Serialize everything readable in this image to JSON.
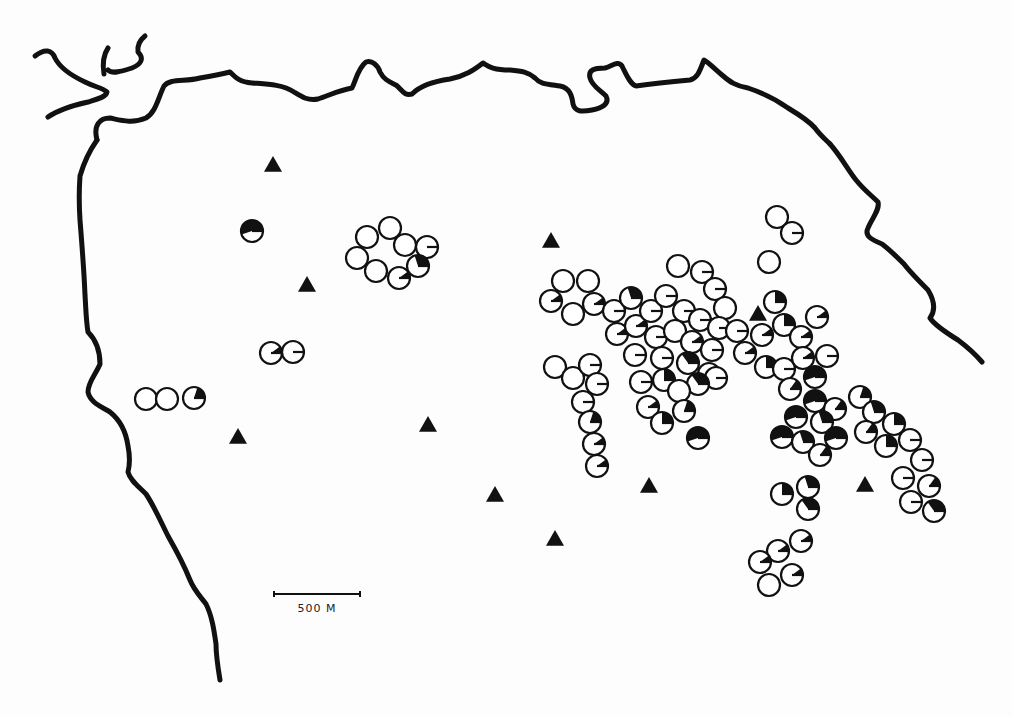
{
  "map": {
    "scale_bar": {
      "label": "500 M",
      "x1": 274,
      "x2": 360,
      "y": 594
    },
    "colors": {
      "ink": "#111111",
      "paper": "#fdfdfd"
    },
    "legend_semantics": {
      "circle": "site (pie fraction filled black)",
      "triangle": "triangle marker"
    },
    "marker_radius": 11,
    "triangles": [
      [
        273,
        165
      ],
      [
        307,
        285
      ],
      [
        551,
        241
      ],
      [
        238,
        437
      ],
      [
        428,
        425
      ],
      [
        495,
        495
      ],
      [
        555,
        539
      ],
      [
        649,
        486
      ],
      [
        758,
        314
      ],
      [
        865,
        485
      ]
    ],
    "sites": [
      {
        "x": 252,
        "y": 231,
        "f": 0.55
      },
      {
        "x": 367,
        "y": 237,
        "f": 0
      },
      {
        "x": 390,
        "y": 228,
        "f": 0
      },
      {
        "x": 405,
        "y": 245,
        "f": 0
      },
      {
        "x": 427,
        "y": 247,
        "f": 0.03
      },
      {
        "x": 357,
        "y": 258,
        "f": 0
      },
      {
        "x": 376,
        "y": 271,
        "f": 0
      },
      {
        "x": 399,
        "y": 278,
        "f": 0.1
      },
      {
        "x": 418,
        "y": 266,
        "f": 0.3
      },
      {
        "x": 271,
        "y": 353,
        "f": 0.1
      },
      {
        "x": 293,
        "y": 352,
        "f": 0.02
      },
      {
        "x": 146,
        "y": 399,
        "f": 0
      },
      {
        "x": 167,
        "y": 399,
        "f": 0
      },
      {
        "x": 194,
        "y": 398,
        "f": 0.2
      },
      {
        "x": 777,
        "y": 217,
        "f": 0
      },
      {
        "x": 792,
        "y": 233,
        "f": 0.02
      },
      {
        "x": 769,
        "y": 262,
        "f": 0
      },
      {
        "x": 563,
        "y": 281,
        "f": 0
      },
      {
        "x": 588,
        "y": 281,
        "f": 0
      },
      {
        "x": 551,
        "y": 301,
        "f": 0.1
      },
      {
        "x": 573,
        "y": 314,
        "f": 0
      },
      {
        "x": 594,
        "y": 304,
        "f": 0.1
      },
      {
        "x": 614,
        "y": 311,
        "f": 0.02
      },
      {
        "x": 631,
        "y": 298,
        "f": 0.3
      },
      {
        "x": 617,
        "y": 334,
        "f": 0.1
      },
      {
        "x": 636,
        "y": 326,
        "f": 0.1
      },
      {
        "x": 651,
        "y": 311,
        "f": 0.02
      },
      {
        "x": 666,
        "y": 296,
        "f": 0.02
      },
      {
        "x": 678,
        "y": 266,
        "f": 0
      },
      {
        "x": 702,
        "y": 272,
        "f": 0.02
      },
      {
        "x": 715,
        "y": 289,
        "f": 0.02
      },
      {
        "x": 725,
        "y": 308,
        "f": 0
      },
      {
        "x": 684,
        "y": 311,
        "f": 0.02
      },
      {
        "x": 700,
        "y": 320,
        "f": 0.02
      },
      {
        "x": 719,
        "y": 328,
        "f": 0.02
      },
      {
        "x": 737,
        "y": 331,
        "f": 0.02
      },
      {
        "x": 656,
        "y": 337,
        "f": 0.02
      },
      {
        "x": 675,
        "y": 331,
        "f": 0
      },
      {
        "x": 692,
        "y": 342,
        "f": 0.1
      },
      {
        "x": 712,
        "y": 350,
        "f": 0.02
      },
      {
        "x": 635,
        "y": 355,
        "f": 0.02
      },
      {
        "x": 662,
        "y": 358,
        "f": 0.02
      },
      {
        "x": 688,
        "y": 363,
        "f": 0.35
      },
      {
        "x": 709,
        "y": 374,
        "f": 0.1
      },
      {
        "x": 716,
        "y": 378,
        "f": 0.02
      },
      {
        "x": 641,
        "y": 382,
        "f": 0.02
      },
      {
        "x": 664,
        "y": 380,
        "f": 0.25
      },
      {
        "x": 698,
        "y": 384,
        "f": 0.35
      },
      {
        "x": 679,
        "y": 391,
        "f": 0
      },
      {
        "x": 648,
        "y": 407,
        "f": 0.1
      },
      {
        "x": 662,
        "y": 423,
        "f": 0.25
      },
      {
        "x": 684,
        "y": 411,
        "f": 0.2
      },
      {
        "x": 698,
        "y": 438,
        "f": 0.55
      },
      {
        "x": 555,
        "y": 367,
        "f": 0
      },
      {
        "x": 573,
        "y": 378,
        "f": 0
      },
      {
        "x": 590,
        "y": 365,
        "f": 0.02
      },
      {
        "x": 597,
        "y": 384,
        "f": 0.02
      },
      {
        "x": 583,
        "y": 402,
        "f": 0.02
      },
      {
        "x": 590,
        "y": 422,
        "f": 0.2
      },
      {
        "x": 594,
        "y": 444,
        "f": 0.1
      },
      {
        "x": 597,
        "y": 466,
        "f": 0.1
      },
      {
        "x": 775,
        "y": 302,
        "f": 0.25
      },
      {
        "x": 817,
        "y": 317,
        "f": 0.1
      },
      {
        "x": 784,
        "y": 325,
        "f": 0.25
      },
      {
        "x": 801,
        "y": 337,
        "f": 0.1
      },
      {
        "x": 762,
        "y": 335,
        "f": 0.1
      },
      {
        "x": 827,
        "y": 356,
        "f": 0.02
      },
      {
        "x": 745,
        "y": 353,
        "f": 0.1
      },
      {
        "x": 766,
        "y": 367,
        "f": 0.25
      },
      {
        "x": 784,
        "y": 369,
        "f": 0.02
      },
      {
        "x": 803,
        "y": 358,
        "f": 0.1
      },
      {
        "x": 815,
        "y": 377,
        "f": 0.55
      },
      {
        "x": 790,
        "y": 389,
        "f": 0.15
      },
      {
        "x": 815,
        "y": 401,
        "f": 0.55
      },
      {
        "x": 835,
        "y": 409,
        "f": 0.15
      },
      {
        "x": 796,
        "y": 417,
        "f": 0.55
      },
      {
        "x": 822,
        "y": 422,
        "f": 0.3
      },
      {
        "x": 782,
        "y": 437,
        "f": 0.55
      },
      {
        "x": 803,
        "y": 442,
        "f": 0.3
      },
      {
        "x": 836,
        "y": 438,
        "f": 0.55
      },
      {
        "x": 820,
        "y": 455,
        "f": 0.15
      },
      {
        "x": 860,
        "y": 397,
        "f": 0.2
      },
      {
        "x": 874,
        "y": 412,
        "f": 0.3
      },
      {
        "x": 894,
        "y": 424,
        "f": 0.25
      },
      {
        "x": 866,
        "y": 432,
        "f": 0.15
      },
      {
        "x": 886,
        "y": 446,
        "f": 0.25
      },
      {
        "x": 910,
        "y": 440,
        "f": 0.02
      },
      {
        "x": 922,
        "y": 460,
        "f": 0.02
      },
      {
        "x": 903,
        "y": 478,
        "f": 0.02
      },
      {
        "x": 929,
        "y": 486,
        "f": 0.15
      },
      {
        "x": 911,
        "y": 502,
        "f": 0.02
      },
      {
        "x": 934,
        "y": 511,
        "f": 0.35
      },
      {
        "x": 782,
        "y": 494,
        "f": 0.25
      },
      {
        "x": 808,
        "y": 487,
        "f": 0.3
      },
      {
        "x": 808,
        "y": 509,
        "f": 0.35
      },
      {
        "x": 801,
        "y": 541,
        "f": 0.1
      },
      {
        "x": 778,
        "y": 551,
        "f": 0.1
      },
      {
        "x": 760,
        "y": 562,
        "f": 0.1
      },
      {
        "x": 792,
        "y": 575,
        "f": 0.1
      },
      {
        "x": 769,
        "y": 585,
        "f": 0
      }
    ],
    "coastlines": [
      "M 35 56 C 45 48, 52 50, 55 58 C 60 68, 70 75, 85 82 C 95 87, 103 88, 107 92 C 106 97, 98 99, 88 102 C 70 106, 58 110, 48 117",
      "M 104 74 C 102 62, 104 54, 108 48 M 108 70 C 112 74, 120 72, 132 68 C 142 64, 144 58, 138 52 C 137 45, 140 40, 145 36",
      "M 97 140 C 93 125, 100 118, 110 118 C 120 120, 132 124, 146 118 C 156 112, 158 98, 164 86 C 170 78, 185 82, 200 78 C 212 76, 222 74, 230 72 C 236 78, 240 82, 252 83 C 265 84, 282 84, 294 92 C 302 97, 308 101, 318 99 C 330 95, 340 90, 352 88 C 356 80, 358 68, 366 62 C 372 60, 378 65, 380 72 C 384 80, 390 82, 396 85 C 402 90, 404 96, 412 94 C 418 88, 428 82, 450 79 C 465 76, 474 70, 483 63 C 488 66, 492 70, 510 70 C 522 71, 528 72, 535 78 C 540 84, 546 84, 560 86 C 570 88, 572 96, 573 104 C 575 112, 582 112, 592 110 C 602 108, 610 104, 606 96 C 600 90, 592 86, 590 78 C 588 70, 594 68, 605 68 C 612 66, 618 60, 622 66 C 626 74, 630 84, 636 86 C 650 84, 668 82, 690 80 C 698 78, 700 70, 704 60 C 708 62, 716 70, 722 75 C 730 82, 736 86, 748 88 C 760 92, 774 98, 788 108 C 798 114, 808 120, 815 128 C 820 135, 826 140, 830 144",
      "M 830 144 C 840 155, 848 170, 856 180 C 864 190, 872 196, 878 202 C 880 210, 872 218, 868 228 C 864 236, 872 240, 882 244 C 890 250, 896 256, 904 264 C 910 272, 918 280, 928 290 C 934 300, 936 310, 930 318 C 934 324, 945 332, 958 340 C 966 346, 976 355, 982 362",
      "M 97 140 C 90 150, 84 162, 80 176 C 79 190, 79 205, 80 220 C 82 245, 84 270, 85 295 C 86 310, 86 320, 88 332 C 96 340, 100 352, 100 364 C 96 374, 88 382, 88 392 C 90 402, 100 406, 110 412 C 120 420, 126 432, 128 446 C 130 456, 130 464, 128 472 C 130 480, 138 486, 146 494 C 154 506, 160 520, 168 536 C 176 550, 184 565, 190 580 C 194 590, 200 596, 206 604 C 212 616, 214 630, 216 644 C 216 656, 218 668, 220 680"
    ]
  }
}
